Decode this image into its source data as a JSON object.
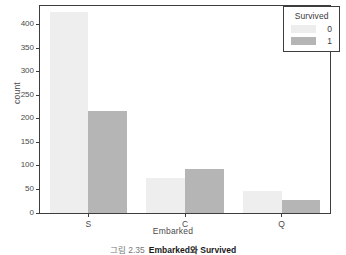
{
  "chart_data": {
    "type": "bar",
    "title": "",
    "xlabel": "Embarked",
    "ylabel": "count",
    "categories": [
      "S",
      "C",
      "Q"
    ],
    "series": [
      {
        "name": "0",
        "values": [
          427,
          75,
          47
        ],
        "color": "#eeeeee"
      },
      {
        "name": "1",
        "values": [
          217,
          93,
          28
        ],
        "color": "#b5b5b5"
      }
    ],
    "legend": {
      "title": "Survived",
      "entries": [
        "0",
        "1"
      ],
      "position": "top-right"
    },
    "ylim": [
      0,
      440
    ],
    "yticks": [
      "0",
      "50",
      "100",
      "150",
      "200",
      "250",
      "300",
      "350",
      "400"
    ],
    "ytick_values": [
      0,
      50,
      100,
      150,
      200,
      250,
      300,
      350,
      400
    ],
    "grid": false
  },
  "caption": {
    "number": "그림 2.35",
    "text": "Embarked와 Survived"
  }
}
